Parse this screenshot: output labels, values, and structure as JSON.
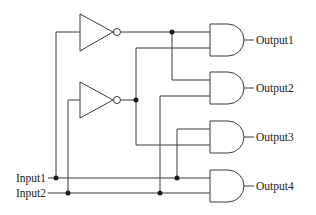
{
  "diagram": {
    "type": "logic-circuit",
    "inputs": [
      {
        "id": "in1",
        "label": "Input1"
      },
      {
        "id": "in2",
        "label": "Input2"
      }
    ],
    "outputs": [
      {
        "id": "out1",
        "label": "Output1"
      },
      {
        "id": "out2",
        "label": "Output2"
      },
      {
        "id": "out3",
        "label": "Output3"
      },
      {
        "id": "out4",
        "label": "Output4"
      }
    ],
    "gates": [
      {
        "id": "not1",
        "type": "NOT",
        "input": "Input1"
      },
      {
        "id": "not2",
        "type": "NOT",
        "input": "Input2"
      },
      {
        "id": "and1",
        "type": "AND",
        "inputs": [
          "NOT Input1",
          "NOT Input2"
        ],
        "output": "Output1"
      },
      {
        "id": "and2",
        "type": "AND",
        "inputs": [
          "NOT Input1",
          "Input2"
        ],
        "output": "Output2"
      },
      {
        "id": "and3",
        "type": "AND",
        "inputs": [
          "Input1",
          "NOT Input2"
        ],
        "output": "Output3"
      },
      {
        "id": "and4",
        "type": "AND",
        "inputs": [
          "Input1",
          "Input2"
        ],
        "output": "Output4"
      }
    ],
    "colors": {
      "wire": "#3a3a3a",
      "junction": "#1a1a1a",
      "background": "#ffffff"
    }
  }
}
